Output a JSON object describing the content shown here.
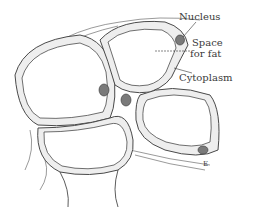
{
  "figure": {
    "labels": {
      "nucleus": "Nucleus",
      "space_for_fat_line1": "Space",
      "space_for_fat_line2": "for fat",
      "cytoplasm": "Cytoplasm"
    },
    "signature": "E",
    "colors": {
      "outline": "#4a4a4a",
      "cytoplasm_fill": "#eeeeee",
      "nucleus_fill": "#7a7a7a",
      "background": "#ffffff"
    }
  }
}
